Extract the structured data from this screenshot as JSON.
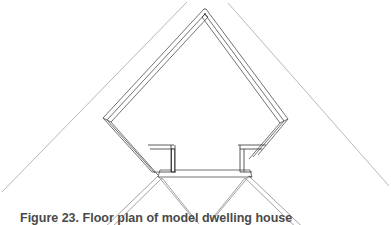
{
  "figure": {
    "caption_label": "Figure 23.",
    "caption_text": "Floor plan of model dwelling house",
    "colors": {
      "outer_roof_line": "#9a9a9a",
      "inner_structure_line": "#555555",
      "detail_line": "#333333",
      "background": "#ffffff",
      "caption_text": "#4a4a4a"
    },
    "line_widths": {
      "outer_roof": 0.7,
      "inner_structure": 0.8,
      "detail": 0.8
    }
  },
  "drawing": {
    "name": "roof-section",
    "apex": {
      "x": 205,
      "y": 8
    },
    "outer_roof": {
      "left_eave": {
        "x": 8,
        "y": 208
      },
      "right_eave": {
        "x": 388,
        "y": 200
      },
      "left_upper_end": {
        "x": 185,
        "y": 2
      },
      "right_upper_end": {
        "x": 228,
        "y": 3
      }
    },
    "knee_wall_left": {
      "x": 103,
      "y": 119
    },
    "knee_wall_right": {
      "x": 287,
      "y": 120
    },
    "floor_level_y": 172,
    "floor_band_top_y": 170,
    "floor_band_bottom_y": 178,
    "cabinet_left": {
      "x1": 150,
      "y1": 145,
      "x2": 178,
      "y2": 174
    },
    "cabinet_right": {
      "x1": 238,
      "y1": 145,
      "x2": 265,
      "y2": 174
    },
    "brace_left_foot": {
      "x": 150,
      "y": 200
    },
    "brace_right_foot": {
      "x": 268,
      "y": 200
    }
  },
  "elements": {
    "outer_roof_left_label": "outer roof slope left",
    "outer_roof_right_label": "outer roof slope right",
    "rafter_left_label": "left rafter assembly",
    "rafter_right_label": "right rafter assembly",
    "knee_wall_left_label": "left knee wall",
    "knee_wall_right_label": "right knee wall",
    "floor_label": "attic floor",
    "cabinet_left_label": "left built-in cabinet",
    "cabinet_right_label": "right built-in cabinet",
    "brace_left_label": "left angled brace",
    "brace_right_label": "right angled brace"
  }
}
